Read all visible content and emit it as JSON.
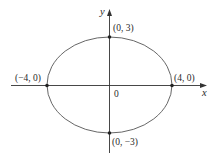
{
  "figure": {
    "type": "ellipse",
    "equation_implied": "x^2/16 + y^2/9 = 1",
    "semi_major_a": 4,
    "semi_minor_b": 3,
    "colors": {
      "stroke": "#3a3a3a",
      "background": "#ffffff"
    }
  },
  "axes": {
    "x_label": "x",
    "y_label": "y",
    "origin_label": "0"
  },
  "points": [
    {
      "id": "top",
      "label": "(0, 3)",
      "x": 0,
      "y": 3
    },
    {
      "id": "right",
      "label": "(4, 0)",
      "x": 4,
      "y": 0
    },
    {
      "id": "bottom",
      "label": "(0, −3)",
      "x": 0,
      "y": -3
    },
    {
      "id": "left",
      "label": "(−4, 0)",
      "x": -4,
      "y": 0
    }
  ]
}
